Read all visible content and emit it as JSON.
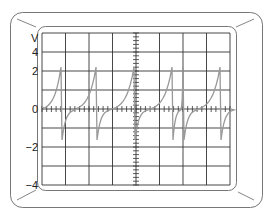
{
  "scope": {
    "y_unit_label": "V",
    "y_tick_labels": [
      {
        "text": "4",
        "y": 52
      },
      {
        "text": "2",
        "y": 71
      },
      {
        "text": "0",
        "y": 109
      },
      {
        "text": "−2",
        "y": 147
      },
      {
        "text": "−4",
        "y": 185
      }
    ],
    "colors": {
      "bezel": "#777777",
      "grid": "#333333",
      "trace": "#999999",
      "background": "#ffffff"
    },
    "grid": {
      "x_lines": [
        42,
        65.5,
        89,
        112.5,
        136,
        159.5,
        183,
        206.5,
        230
      ],
      "y_lines": [
        33,
        52,
        71,
        90,
        109,
        128,
        147,
        166,
        185
      ],
      "center_x": 136,
      "zero_y": 109
    },
    "spikes": [
      {
        "x": 61,
        "peak_y": 67,
        "trough_y": 140
      },
      {
        "x": 96,
        "peak_y": 67,
        "trough_y": 140
      },
      {
        "x": 134,
        "peak_y": 67,
        "trough_y": 140
      },
      {
        "x": 172,
        "peak_y": 67,
        "trough_y": 140
      },
      {
        "x": 183,
        "peak_y": 67,
        "trough_y": 140
      },
      {
        "x": 220,
        "peak_y": 67,
        "trough_y": 140
      }
    ]
  },
  "chart_data": {
    "type": "line",
    "title": "",
    "xlabel": "",
    "ylabel": "V",
    "y_tick_labels": [
      "4",
      "2",
      "0",
      "-2",
      "-4"
    ],
    "grid": true,
    "spike_times_div": [
      0.8,
      2.3,
      3.9,
      5.5,
      6.0,
      7.6
    ],
    "peak_voltage": 2.5,
    "trough_voltage": -1.7
  }
}
